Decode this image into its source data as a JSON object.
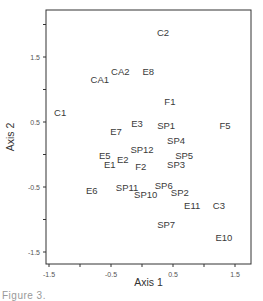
{
  "chart_data": {
    "type": "scatter",
    "title": "",
    "xlabel": "Axis 1",
    "ylabel": "Axis 2",
    "xlim": [
      -1.55,
      1.8
    ],
    "ylim": [
      -1.7,
      2.2
    ],
    "xticks": [
      -1.5,
      -1.0,
      -0.5,
      0.0,
      0.5,
      1.0,
      1.5
    ],
    "xtick_labels": [
      "-1.5",
      "",
      "-0.5",
      "",
      "0.5",
      "",
      "1.5"
    ],
    "yticks": [
      -1.5,
      -1.0,
      -0.5,
      0.0,
      0.5,
      1.0,
      1.5,
      2.0
    ],
    "ytick_labels": [
      "-1.5",
      "",
      "-0.5",
      "",
      "0.5",
      "",
      "1.5",
      ""
    ],
    "grid": false,
    "legend": null,
    "marker": "text-label",
    "points": [
      {
        "label": "C2",
        "x": 0.34,
        "y": 1.88
      },
      {
        "label": "CA1",
        "x": -0.68,
        "y": 1.16
      },
      {
        "label": "CA2",
        "x": -0.35,
        "y": 1.27
      },
      {
        "label": "E8",
        "x": 0.1,
        "y": 1.27
      },
      {
        "label": "C1",
        "x": -1.32,
        "y": 0.65
      },
      {
        "label": "F1",
        "x": 0.45,
        "y": 0.81
      },
      {
        "label": "E3",
        "x": -0.08,
        "y": 0.47
      },
      {
        "label": "SP1",
        "x": 0.39,
        "y": 0.44
      },
      {
        "label": "F5",
        "x": 1.34,
        "y": 0.45
      },
      {
        "label": "E7",
        "x": -0.42,
        "y": 0.36
      },
      {
        "label": "SP4",
        "x": 0.55,
        "y": 0.21
      },
      {
        "label": "SP12",
        "x": 0.0,
        "y": 0.07
      },
      {
        "label": "E5",
        "x": -0.6,
        "y": -0.01
      },
      {
        "label": "E2",
        "x": -0.31,
        "y": -0.07
      },
      {
        "label": "SP5",
        "x": 0.68,
        "y": -0.01
      },
      {
        "label": "E1",
        "x": -0.52,
        "y": -0.16
      },
      {
        "label": "F2",
        "x": -0.02,
        "y": -0.18
      },
      {
        "label": "SP3",
        "x": 0.55,
        "y": -0.15
      },
      {
        "label": "E6",
        "x": -0.81,
        "y": -0.55
      },
      {
        "label": "SP11",
        "x": -0.24,
        "y": -0.5
      },
      {
        "label": "SP6",
        "x": 0.35,
        "y": -0.47
      },
      {
        "label": "SP10",
        "x": 0.06,
        "y": -0.62
      },
      {
        "label": "SP2",
        "x": 0.61,
        "y": -0.58
      },
      {
        "label": "E11",
        "x": 0.81,
        "y": -0.78
      },
      {
        "label": "C3",
        "x": 1.24,
        "y": -0.79
      },
      {
        "label": "SP7",
        "x": 0.39,
        "y": -1.08
      },
      {
        "label": "E10",
        "x": 1.32,
        "y": -1.27
      }
    ]
  },
  "layout": {
    "frame": {
      "left": 46,
      "top": 10,
      "right": 251,
      "bottom": 264
    },
    "x_origin_px": 49,
    "x_value_at_origin": -1.5,
    "x_px_per_unit": 62,
    "y_origin_px": 57,
    "y_value_at_origin": 1.5,
    "y_px_per_unit": 65
  },
  "caption_partial": "Figure 3."
}
